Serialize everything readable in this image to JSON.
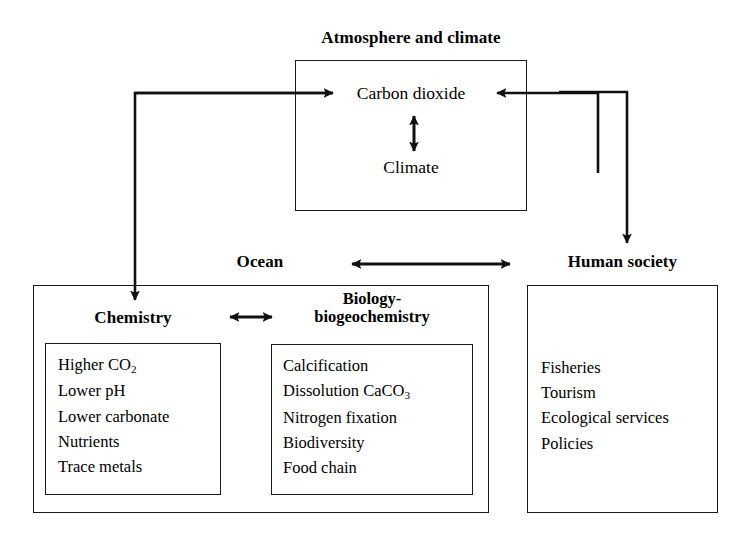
{
  "diagram": {
    "title_hidden": "",
    "atmosphere": {
      "header": "Atmosphere and climate",
      "nodes": {
        "co2": "Carbon dioxide",
        "climate": "Climate"
      }
    },
    "ocean": {
      "header": "Ocean",
      "chemistry": {
        "header": "Chemistry",
        "items": [
          "Higher CO2",
          "Lower pH",
          "Lower carbonate",
          "Nutrients",
          "Trace metals"
        ]
      },
      "biology": {
        "header_line1": "Biology-",
        "header_line2": "biogeochemistry",
        "items": [
          "Calcification",
          "Dissolution CaCO3",
          "Nitrogen fixation",
          "Biodiversity",
          "Food chain"
        ]
      }
    },
    "society": {
      "header": "Human society",
      "items": [
        "Fisheries",
        "Tourism",
        "Ecological services",
        "Policies"
      ]
    },
    "connectors": [
      {
        "name": "ocean-to-atmosphere",
        "style": "single-arrow",
        "from": "Ocean chemistry",
        "to": "Carbon dioxide"
      },
      {
        "name": "society-to-atmosphere",
        "style": "single-arrow",
        "from": "Human society",
        "to": "Carbon dioxide"
      },
      {
        "name": "atmosphere-to-society",
        "style": "single-arrow",
        "from": "Carbon dioxide",
        "to": "Human society"
      },
      {
        "name": "co2-climate",
        "style": "double-arrow",
        "from": "Carbon dioxide",
        "to": "Climate"
      },
      {
        "name": "chemistry-biology",
        "style": "double-arrow",
        "from": "Chemistry",
        "to": "Biology-biogeochemistry"
      },
      {
        "name": "ocean-society",
        "style": "double-arrow",
        "from": "Ocean",
        "to": "Human society"
      }
    ],
    "colors": {
      "stroke": "#1a1a1a",
      "background": "#ffffff"
    }
  }
}
